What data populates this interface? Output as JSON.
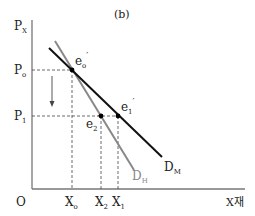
{
  "title": "(b)",
  "axes": {
    "y_label": "P",
    "y_label_sub": "X",
    "x_label": "X재",
    "origin": "O"
  },
  "price_levels": [
    {
      "label": "P",
      "sub": "o"
    },
    {
      "label": "P",
      "sub": "1"
    }
  ],
  "quantities": [
    {
      "label": "X",
      "sub": "o"
    },
    {
      "label": "X",
      "sub": "2"
    },
    {
      "label": "X",
      "sub": "1"
    }
  ],
  "points": [
    {
      "label": "e",
      "sub": "o",
      "prime": "′"
    },
    {
      "label": "e",
      "sub": "2",
      "prime": "′"
    },
    {
      "label": "e",
      "sub": "1",
      "prime": "′"
    }
  ],
  "curves": [
    {
      "label": "D",
      "sub": "M",
      "color": "#111111"
    },
    {
      "label": "D",
      "sub": "H",
      "color": "#888888"
    }
  ]
}
